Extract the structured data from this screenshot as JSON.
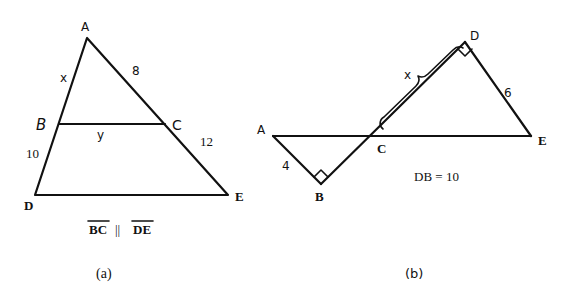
{
  "figure_a": {
    "caption": "(a)",
    "vertices": {
      "A": {
        "label": "A",
        "x": 87,
        "y": 38
      },
      "B": {
        "label": "B",
        "x": 59,
        "y": 124
      },
      "C": {
        "label": "C",
        "x": 165,
        "y": 124
      },
      "D": {
        "label": "D",
        "x": 35,
        "y": 195
      },
      "E": {
        "label": "E",
        "x": 228,
        "y": 195
      }
    },
    "segment_labels": {
      "AB": "x",
      "AC": "8",
      "BC": "y",
      "BD": "10",
      "CE": "12"
    },
    "relation": {
      "left": "BC",
      "symbol": "||",
      "right": "DE"
    }
  },
  "figure_b": {
    "caption": "(b)",
    "vertices": {
      "A": {
        "label": "A",
        "x": 273,
        "y": 136
      },
      "B": {
        "label": "B",
        "x": 321,
        "y": 184
      },
      "C": {
        "label": "C",
        "x": 383,
        "y": 136
      },
      "D": {
        "label": "D",
        "x": 465,
        "y": 42
      },
      "E": {
        "label": "E",
        "x": 531,
        "y": 136
      }
    },
    "segment_labels": {
      "AB": "4",
      "DE": "6",
      "CD": "x"
    },
    "right_angles": [
      "B",
      "D"
    ],
    "given": "DB = 10"
  }
}
